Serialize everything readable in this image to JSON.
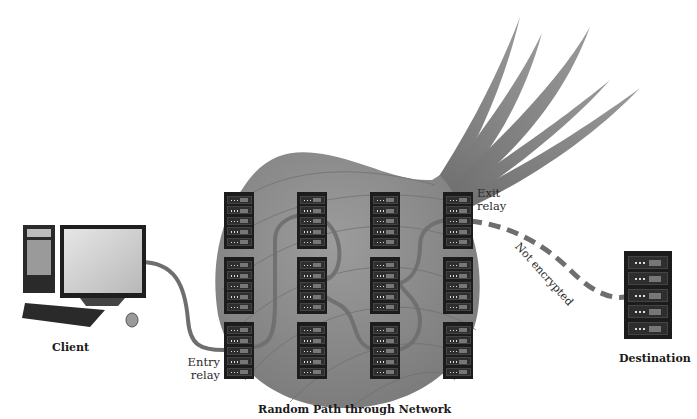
{
  "diagram": {
    "title": "Random Path through Network",
    "nodes": {
      "client": {
        "label": "Client"
      },
      "destination": {
        "label": "Destination"
      },
      "entry_relay": {
        "label_line1": "Entry",
        "label_line2": "relay"
      },
      "exit_relay": {
        "label_line1": "Exit",
        "label_line2": "relay"
      }
    },
    "edges": {
      "unencrypted_link": {
        "label": "Not encrypted",
        "style": "dashed"
      }
    },
    "relay_grid": {
      "columns": 4,
      "rows": 3,
      "units_per_rack": 5
    },
    "colors": {
      "onion_body": "#8c8c8c",
      "onion_stalk": "#7a7a7a",
      "cable": "#6e6e6e",
      "rack": "#1c1c1c",
      "text": "#2a2a2a"
    }
  }
}
